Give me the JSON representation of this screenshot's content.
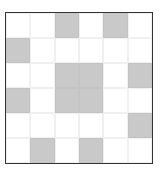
{
  "puzzle": {
    "rows": 6,
    "cols": 6,
    "colors": {
      "filled": "#c9c9c9",
      "empty": "#ffffff",
      "border": "#333333"
    },
    "grid": [
      [
        0,
        0,
        1,
        0,
        1,
        0
      ],
      [
        1,
        0,
        0,
        0,
        0,
        0
      ],
      [
        0,
        0,
        1,
        1,
        0,
        1
      ],
      [
        1,
        0,
        1,
        1,
        0,
        0
      ],
      [
        0,
        0,
        0,
        0,
        0,
        1
      ],
      [
        0,
        1,
        0,
        1,
        0,
        0
      ]
    ]
  }
}
